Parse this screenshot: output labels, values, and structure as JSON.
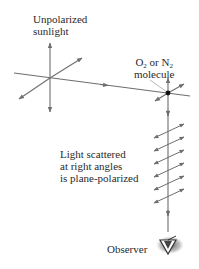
{
  "diagram": {
    "labels": {
      "unpolarized": [
        "Unpolarized",
        "sunlight"
      ],
      "molecule": {
        "line1_parts": [
          "O",
          "2",
          " or N",
          "2"
        ],
        "line2": "molecule"
      },
      "scattered": [
        "Light scattered",
        "at right angles",
        "is plane-polarized"
      ],
      "observer": "Observer"
    },
    "colors": {
      "line": "#6e6e6e",
      "text": "#2a2a2a",
      "molecule_dot": "#111111",
      "eye_shadow": "#8a8a8a"
    },
    "icons": [
      "eye-icon",
      "molecule-dot"
    ]
  }
}
